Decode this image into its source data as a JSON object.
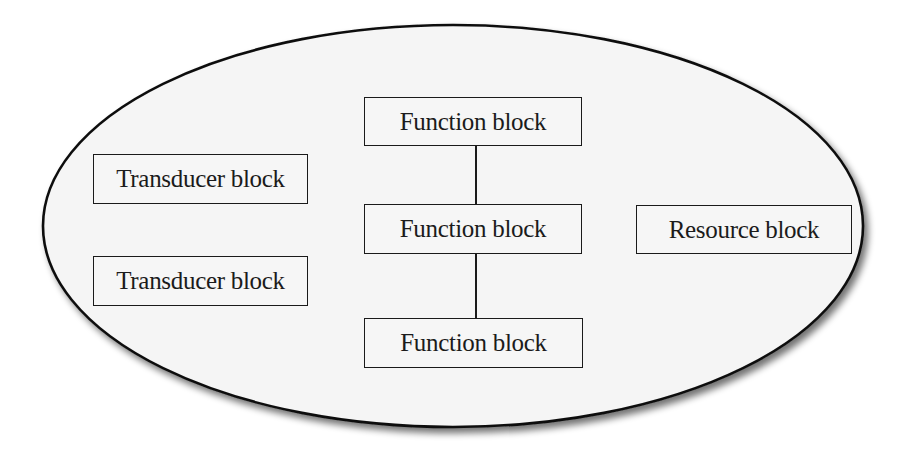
{
  "diagram": {
    "container": {
      "shape": "ellipse",
      "fill": "#f5f5f5",
      "stroke": "#111111"
    },
    "blocks": {
      "function_top": {
        "label": "Function block"
      },
      "function_middle": {
        "label": "Function block"
      },
      "function_bottom": {
        "label": "Function block"
      },
      "transducer_top": {
        "label": "Transducer block"
      },
      "transducer_bottom": {
        "label": "Transducer block"
      },
      "resource": {
        "label": "Resource block"
      }
    },
    "connections": [
      {
        "from": "function_top",
        "to": "function_middle"
      },
      {
        "from": "function_middle",
        "to": "function_bottom"
      }
    ]
  }
}
